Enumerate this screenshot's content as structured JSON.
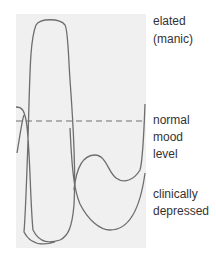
{
  "diagram": {
    "labels": {
      "top_line1": "elated",
      "top_line2": "(manic)",
      "mid_line1": "normal",
      "mid_line2": "mood",
      "mid_line3": "level",
      "bottom_line1": "clinically",
      "bottom_line2": "depressed"
    },
    "colors": {
      "panel": "#f0f0f0",
      "curve": "#6e6e6e",
      "baseline": "#707070",
      "text": "#333333"
    }
  }
}
